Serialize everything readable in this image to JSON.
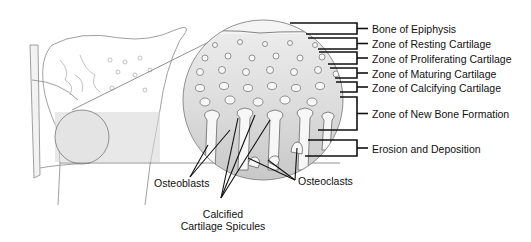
{
  "zones": [
    {
      "label": "Bone of Epiphysis",
      "y": 23,
      "y2": 34
    },
    {
      "label": "Zone of Resting Cartilage",
      "y": 38,
      "y2": 49
    },
    {
      "label": "Zone of Proliferating Cartilage",
      "y": 52,
      "y2": 64
    },
    {
      "label": "Zone of Maturing Cartilage",
      "y": 68,
      "y2": 78
    },
    {
      "label": "Zone of Calcifying Cartilage",
      "y": 82,
      "y2": 92
    },
    {
      "label": "Zone of New Bone Formation",
      "y": 97,
      "y2": 130
    },
    {
      "label": "Erosion and Deposition",
      "y": 140,
      "y2": 156
    }
  ],
  "callouts": {
    "osteoblasts": "Osteoblasts",
    "osteoclasts": "Osteoclasts",
    "spicules_line1": "Calcified",
    "spicules_line2": "Cartilage Spicules"
  },
  "colors": {
    "stroke": "#222222",
    "fill_light": "#e6e6e6",
    "fill_dark": "#c4c4c4"
  }
}
